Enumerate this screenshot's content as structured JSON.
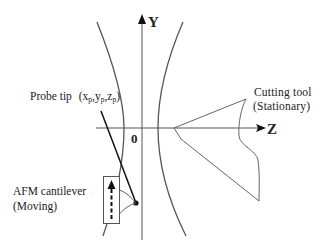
{
  "axes": {
    "y_label": "Y",
    "z_label": "Z",
    "origin_label": "0"
  },
  "labels": {
    "probe_tip": {
      "text": "Probe tip",
      "coord_open": "(x",
      "sub_x": "p",
      "sep1": ",y",
      "sub_y": "p",
      "sep2": ",z",
      "sub_z": "p",
      "coord_close": ")"
    },
    "cutting_tool": {
      "line1": "Cutting tool",
      "line2": "(Stationary)"
    },
    "cantilever": {
      "line1": "AFM cantilever",
      "line2": "(Moving)"
    }
  },
  "colors": {
    "line": "#555555",
    "dark": "#111111",
    "text": "#222222"
  }
}
